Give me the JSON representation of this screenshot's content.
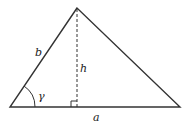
{
  "diagram": {
    "labels": {
      "side_b": "b",
      "height": "h",
      "angle": "γ",
      "side_a": "a"
    },
    "colors": {
      "stroke": "#333333",
      "background": "#ffffff"
    }
  }
}
